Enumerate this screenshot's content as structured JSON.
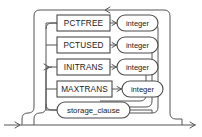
{
  "diagram": {
    "type": "railroad-syntax-diagram",
    "colors": {
      "background": "#ffffff",
      "rail": "#555555",
      "node_stroke": "#4a4a4a",
      "node_fill": "#ffffff",
      "text": "#1a1a1a"
    },
    "entry_arrow": "→",
    "exit_arrow": "→",
    "loopback_arrow": "←",
    "bypass_arrow": "→",
    "rows": [
      {
        "id": "pctfree",
        "keyword": "PCTFREE",
        "keyword_shape": "rect",
        "argument": "integer",
        "argument_shape": "capsule",
        "has_argument": true
      },
      {
        "id": "pctused",
        "keyword": "PCTUSED",
        "keyword_shape": "rect",
        "argument": "integer",
        "argument_shape": "capsule",
        "has_argument": true
      },
      {
        "id": "initrans",
        "keyword": "INITRANS",
        "keyword_shape": "rect",
        "argument": "integer",
        "argument_shape": "capsule",
        "has_argument": true
      },
      {
        "id": "maxtrans",
        "keyword": "MAXTRANS",
        "keyword_shape": "rect",
        "argument": "integer",
        "argument_shape": "capsule",
        "has_argument": true
      },
      {
        "id": "storage_clause",
        "keyword": "storage_clause",
        "keyword_shape": "capsule",
        "argument": "",
        "argument_shape": "",
        "has_argument": false
      }
    ]
  },
  "geometry": {
    "width": 202,
    "height": 137,
    "row_y": [
      23,
      45,
      67,
      89,
      110
    ],
    "box_left": 57,
    "box_right": 110,
    "cap_left": 117,
    "cap_right": 158
  }
}
